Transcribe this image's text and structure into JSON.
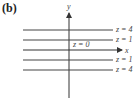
{
  "panel_label": "(b)",
  "axes": {
    "x_label": "x",
    "y_label": "y"
  },
  "level_curves": [
    {
      "label": "z = 4",
      "y": 30
    },
    {
      "label": "z = 1",
      "y": 40
    },
    {
      "label": "z = 0",
      "y": 50
    },
    {
      "label": "z = 1",
      "y": 60
    },
    {
      "label": "z = 4",
      "y": 70
    }
  ],
  "center_label": "z = 0"
}
